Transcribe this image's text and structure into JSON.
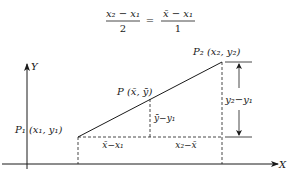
{
  "equation": {
    "lhs_numerator": "x₂ − x₁",
    "lhs_denominator": "2",
    "equals": "=",
    "rhs_numerator": "x̄ − x₁",
    "rhs_denominator": "1"
  },
  "axes": {
    "x_label": "X",
    "y_label": "Y"
  },
  "points": {
    "p1": "P₁ (x₁, y₁)",
    "p2": "P₂ (x₂, y₂)",
    "p": "P (x̄, ȳ)"
  },
  "segments": {
    "ybar_minus_y1": "ȳ−y₁",
    "xbar_minus_x1": "x̄−x₁",
    "x2_minus_xbar": "x₂−x̄",
    "y2_minus_y1": "y₂−y₁"
  },
  "colors": {
    "ink": "#1a1a1a",
    "background": "#ffffff"
  }
}
